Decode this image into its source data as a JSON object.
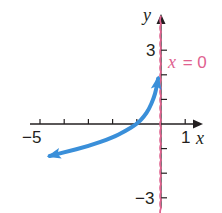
{
  "chart_data": {
    "type": "line",
    "title": "",
    "xlabel": "x",
    "ylabel": "y",
    "xlim": [
      -5,
      1
    ],
    "ylim": [
      -3,
      3
    ],
    "x_tick_labels": [
      "-5",
      "1"
    ],
    "y_tick_labels": [
      "3",
      "-3"
    ],
    "x_ticks": [
      -5,
      -4,
      -3,
      -2,
      -1,
      0,
      1
    ],
    "y_ticks": [
      -3,
      -2,
      -1,
      0,
      1,
      2,
      3
    ],
    "grid": false,
    "asymptote": {
      "equation": "x = 0",
      "label_var": "x",
      "label_rest": " = 0",
      "color": "#e0628f",
      "style": "dashed"
    },
    "series": [
      {
        "name": "curve",
        "color": "#3a8fd9",
        "points": [
          [
            -4.6,
            -1.3
          ],
          [
            -4,
            -1.15
          ],
          [
            -3,
            -0.9
          ],
          [
            -2,
            -0.55
          ],
          [
            -1.5,
            -0.3
          ],
          [
            -1,
            0
          ],
          [
            -0.7,
            0.3
          ],
          [
            -0.5,
            0.6
          ],
          [
            -0.3,
            1.05
          ],
          [
            -0.2,
            1.4
          ],
          [
            -0.12,
            1.85
          ]
        ],
        "arrows": "both"
      }
    ]
  },
  "labels": {
    "y_axis": "y",
    "x_axis": "x",
    "y_top": "3",
    "y_bottom": "−3",
    "x_left": "−5",
    "x_right": "1",
    "asym_var": "x",
    "asym_rest": " = 0"
  }
}
